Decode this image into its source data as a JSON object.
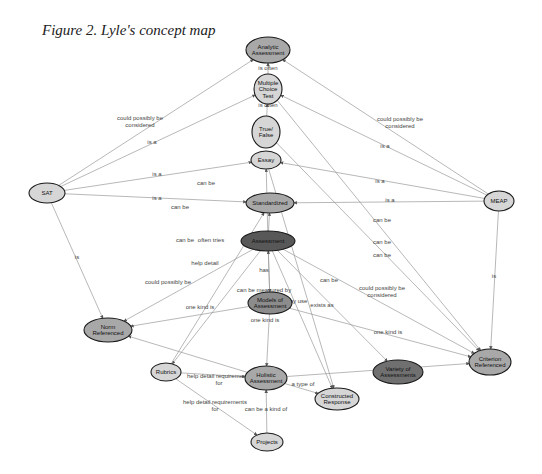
{
  "figure": {
    "title": "Figure 2. Lyle's concept map"
  },
  "nodes": [
    {
      "id": "analytic",
      "lines": [
        "Analytic",
        "Assessment"
      ],
      "x": 268,
      "y": 50,
      "rx": 22,
      "ry": 13,
      "fill": "#a8a8a8"
    },
    {
      "id": "mct",
      "lines": [
        "Multiple",
        "Choice",
        "Test"
      ],
      "x": 268,
      "y": 89,
      "rx": 14,
      "ry": 15,
      "fill": "#d6d6d6"
    },
    {
      "id": "truefalse",
      "lines": [
        "True/",
        "False"
      ],
      "x": 266,
      "y": 132,
      "rx": 14,
      "ry": 16,
      "fill": "#d6d6d6"
    },
    {
      "id": "essay",
      "lines": [
        "Essay"
      ],
      "x": 266,
      "y": 160,
      "rx": 15,
      "ry": 9,
      "fill": "#d6d6d6"
    },
    {
      "id": "sat",
      "lines": [
        "SAT"
      ],
      "x": 47,
      "y": 193,
      "rx": 18,
      "ry": 10,
      "fill": "#d6d6d6"
    },
    {
      "id": "meap",
      "lines": [
        "MEAP"
      ],
      "x": 499,
      "y": 201,
      "rx": 15,
      "ry": 10,
      "fill": "#d6d6d6"
    },
    {
      "id": "standardized",
      "lines": [
        "Standardized"
      ],
      "x": 270,
      "y": 203,
      "rx": 24,
      "ry": 10,
      "fill": "#a8a8a8"
    },
    {
      "id": "assessment",
      "lines": [
        "Assessment"
      ],
      "x": 268,
      "y": 241,
      "rx": 27,
      "ry": 10,
      "fill": "#585858"
    },
    {
      "id": "models",
      "lines": [
        "Models of",
        "Assessment"
      ],
      "x": 270,
      "y": 303,
      "rx": 22,
      "ry": 11,
      "fill": "#8c8c8c"
    },
    {
      "id": "norm",
      "lines": [
        "Norm",
        "Referenced"
      ],
      "x": 108,
      "y": 330,
      "rx": 24,
      "ry": 12,
      "fill": "#a8a8a8"
    },
    {
      "id": "criterion",
      "lines": [
        "Criterion",
        "Referenced"
      ],
      "x": 490,
      "y": 362,
      "rx": 21,
      "ry": 13,
      "fill": "#a8a8a8"
    },
    {
      "id": "variety",
      "lines": [
        "Variety of",
        "Assessments"
      ],
      "x": 398,
      "y": 372,
      "rx": 25,
      "ry": 12,
      "fill": "#707070"
    },
    {
      "id": "rubrics",
      "lines": [
        "Rubrics"
      ],
      "x": 166,
      "y": 372,
      "rx": 15,
      "ry": 9,
      "fill": "#d6d6d6"
    },
    {
      "id": "holistic",
      "lines": [
        "Holistic",
        "Assessment"
      ],
      "x": 266,
      "y": 378,
      "rx": 21,
      "ry": 12,
      "fill": "#a8a8a8"
    },
    {
      "id": "constructed",
      "lines": [
        "Constructed",
        "Response"
      ],
      "x": 337,
      "y": 399,
      "rx": 22,
      "ry": 11,
      "fill": "#d6d6d6"
    },
    {
      "id": "projects",
      "lines": [
        "Projects"
      ],
      "x": 267,
      "y": 442,
      "rx": 16,
      "ry": 9,
      "fill": "#d6d6d6"
    }
  ],
  "edges": [
    {
      "from": "mct",
      "to": "analytic",
      "label": "is often",
      "lx": 268,
      "ly": 70
    },
    {
      "from": "truefalse",
      "to": "mct",
      "label": "is often",
      "lx": 268,
      "ly": 107
    },
    {
      "from": "sat",
      "to": "analytic",
      "label": "could possibly be considered",
      "lx": 140,
      "ly": 120
    },
    {
      "from": "meap",
      "to": "analytic",
      "label": "could possibly be considered",
      "lx": 400,
      "ly": 121
    },
    {
      "from": "sat",
      "to": "mct",
      "label": "is a",
      "lx": 152,
      "ly": 144
    },
    {
      "from": "meap",
      "to": "mct",
      "label": "is a",
      "lx": 385,
      "ly": 148
    },
    {
      "from": "sat",
      "to": "essay",
      "label": "is a",
      "lx": 157,
      "ly": 176
    },
    {
      "from": "meap",
      "to": "essay",
      "label": "is a",
      "lx": 380,
      "ly": 183
    },
    {
      "from": "sat",
      "to": "standardized",
      "label": "is a",
      "lx": 157,
      "ly": 200
    },
    {
      "from": "meap",
      "to": "standardized",
      "label": "is a",
      "lx": 390,
      "ly": 202
    },
    {
      "from": "sat",
      "to": "norm",
      "label": "is",
      "lx": 77,
      "ly": 259
    },
    {
      "from": "meap",
      "to": "criterion",
      "label": "is",
      "lx": 494,
      "ly": 278
    },
    {
      "from": "assessment",
      "to": "standardized",
      "label": "can be",
      "lx": 206,
      "ly": 185
    },
    {
      "from": "assessment",
      "to": "essay",
      "label": "can be",
      "lx": 180,
      "ly": 209
    },
    {
      "from": "assessment",
      "to": "norm",
      "label": "can be",
      "lx": 185,
      "ly": 242
    },
    {
      "from": "assessment",
      "to": "rubrics",
      "label": "often tries",
      "lx": 211,
      "ly": 242
    },
    {
      "from": "assessment",
      "to": "criterion",
      "label": "can be",
      "lx": 382,
      "ly": 222
    },
    {
      "from": "mct",
      "to": "criterion",
      "label": "can be",
      "lx": 382,
      "ly": 244
    },
    {
      "from": "truefalse",
      "to": "criterion",
      "label": "can be",
      "lx": 382,
      "ly": 257
    },
    {
      "from": "holistic",
      "to": "norm",
      "label": "could possibly be",
      "lx": 168,
      "ly": 284
    },
    {
      "from": "holistic",
      "to": "criterion",
      "label": "could possibly be considered",
      "lx": 382,
      "ly": 290
    },
    {
      "from": "rubrics",
      "to": "standardized",
      "label": "help detail",
      "lx": 205,
      "ly": 265
    },
    {
      "from": "assessment",
      "to": "models",
      "label": "has",
      "lx": 264,
      "ly": 272
    },
    {
      "from": "models",
      "to": "assessment",
      "label": "can be measured by",
      "lx": 264,
      "ly": 292
    },
    {
      "from": "models",
      "to": "norm",
      "label": "one kind is",
      "lx": 200,
      "ly": 309
    },
    {
      "from": "models",
      "to": "holistic",
      "label": "one kind is",
      "lx": 265,
      "ly": 322
    },
    {
      "from": "models",
      "to": "criterion",
      "label": "one kind is",
      "lx": 388,
      "ly": 334
    },
    {
      "from": "assessment",
      "to": "constructed",
      "label": "may use",
      "lx": 296,
      "ly": 303
    },
    {
      "from": "assessment",
      "to": "variety",
      "label": "exists as",
      "lx": 322,
      "ly": 307
    },
    {
      "from": "essay",
      "to": "constructed",
      "label": "can be",
      "lx": 329,
      "ly": 282
    },
    {
      "from": "rubrics",
      "to": "holistic",
      "label": "help detail requirements for",
      "lx": 219,
      "ly": 378
    },
    {
      "from": "rubrics",
      "to": "projects",
      "label": "help detail requirements for",
      "lx": 215,
      "ly": 404
    },
    {
      "from": "holistic",
      "to": "constructed",
      "label": "a type of",
      "lx": 303,
      "ly": 386
    },
    {
      "from": "projects",
      "to": "holistic",
      "label": "can be a kind of",
      "lx": 266,
      "ly": 411
    }
  ],
  "colors": {
    "edge": "#9a9a9a",
    "node_stroke": "#1a1a1a",
    "background": "#ffffff"
  }
}
